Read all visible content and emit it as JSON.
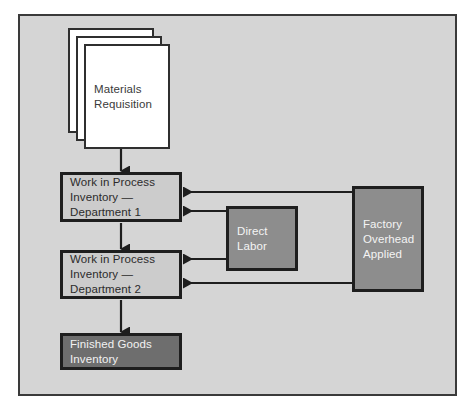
{
  "diagram": {
    "background_color": "#d5d5d5",
    "frame_border_color": "#3a3a3a",
    "nodes": {
      "materials_requisition": {
        "label": "Materials\nRequisition",
        "shape": "stacked-documents",
        "sheet_count": 3,
        "fill": "#ffffff",
        "text_color": "#3a3a3a"
      },
      "wip_dept1": {
        "label": "Work in Process\nInventory —\nDepartment 1",
        "shape": "rectangle",
        "fill": "#cccccc",
        "text_color": "#2b2b2b"
      },
      "wip_dept2": {
        "label": "Work in Process\nInventory —\nDepartment 2",
        "shape": "rectangle",
        "fill": "#cccccc",
        "text_color": "#2b2b2b"
      },
      "finished_goods": {
        "label": "Finished Goods\nInventory",
        "shape": "rectangle",
        "fill": "#6e6e6e",
        "text_color": "#f2f2f2"
      },
      "direct_labor": {
        "label": "Direct\nLabor",
        "shape": "rectangle",
        "fill": "#8d8d8d",
        "text_color": "#f4f4f4"
      },
      "factory_overhead_applied": {
        "label": "Factory\nOverhead\nApplied",
        "shape": "rectangle",
        "fill": "#8d8d8d",
        "text_color": "#f4f4f4"
      }
    },
    "connectors": [
      {
        "from": "materials_requisition",
        "to": "wip_dept1",
        "direction": "down"
      },
      {
        "from": "wip_dept1",
        "to": "wip_dept2",
        "direction": "down"
      },
      {
        "from": "wip_dept2",
        "to": "finished_goods",
        "direction": "down"
      },
      {
        "from": "factory_overhead_applied",
        "to": "wip_dept1",
        "direction": "left"
      },
      {
        "from": "direct_labor",
        "to": "wip_dept1",
        "direction": "left"
      },
      {
        "from": "direct_labor",
        "to": "wip_dept2",
        "direction": "left"
      },
      {
        "from": "factory_overhead_applied",
        "to": "wip_dept2",
        "direction": "left"
      }
    ],
    "arrow_color": "#1e1e1e"
  }
}
